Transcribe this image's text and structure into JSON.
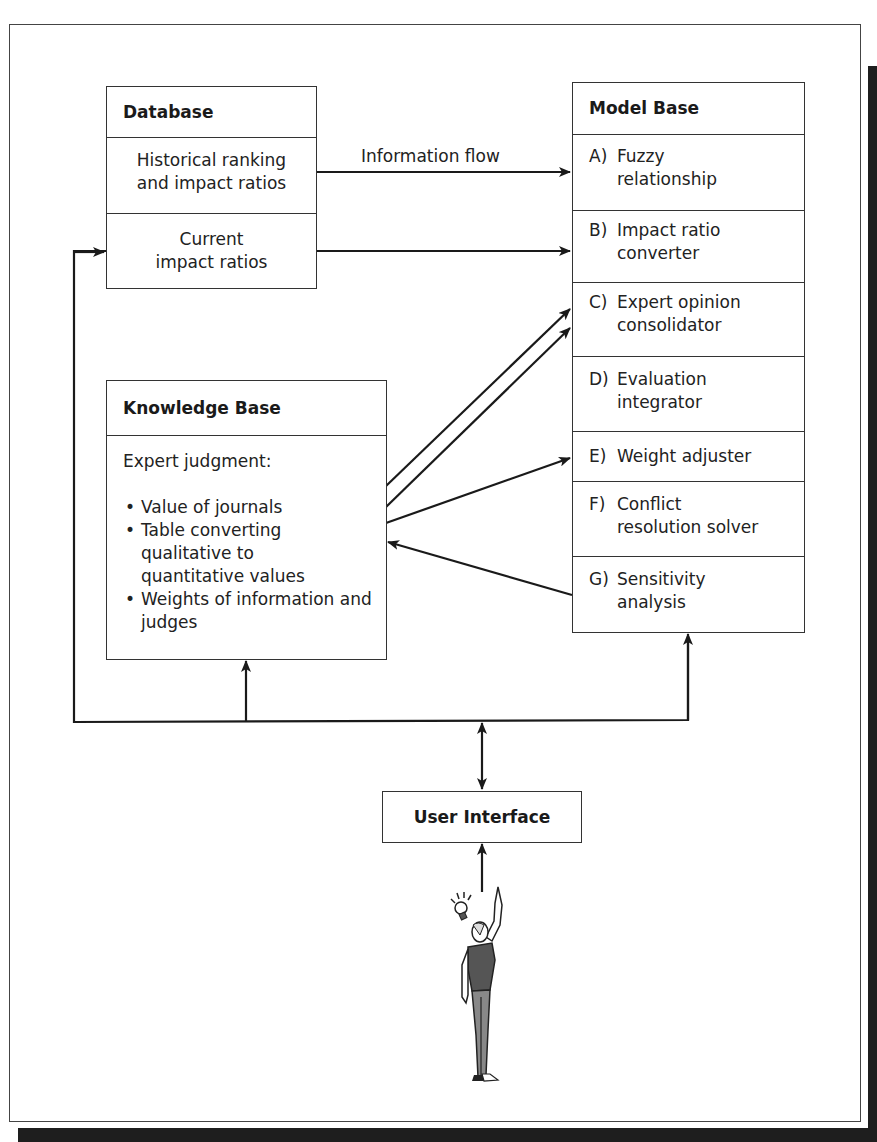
{
  "database": {
    "title": "Database",
    "rows": [
      {
        "line1": "Historical ranking",
        "line2": "and impact ratios"
      },
      {
        "line1": "Current",
        "line2": "impact ratios"
      }
    ]
  },
  "model_base": {
    "title": "Model Base",
    "items": [
      {
        "key": "A)",
        "line1": "Fuzzy",
        "line2": "relationship"
      },
      {
        "key": "B)",
        "line1": "Impact ratio",
        "line2": "converter"
      },
      {
        "key": "C)",
        "line1": "Expert opinion",
        "line2": "consolidator"
      },
      {
        "key": "D)",
        "line1": "Evaluation",
        "line2": "integrator"
      },
      {
        "key": "E)",
        "line1": "Weight adjuster",
        "line2": ""
      },
      {
        "key": "F)",
        "line1": "Conflict",
        "line2": "resolution solver"
      },
      {
        "key": "G)",
        "line1": "Sensitivity",
        "line2": "analysis"
      }
    ]
  },
  "knowledge_base": {
    "title": "Knowledge Base",
    "intro": "Expert judgment:",
    "bullets": [
      "Value of journals",
      "Table converting qualitative to quantitative values",
      "Weights of information and judges"
    ]
  },
  "flow_label": "Information flow",
  "user_interface": {
    "title": "User Interface"
  },
  "user_figure": {
    "icon": "person-with-lightbulb-icon"
  }
}
